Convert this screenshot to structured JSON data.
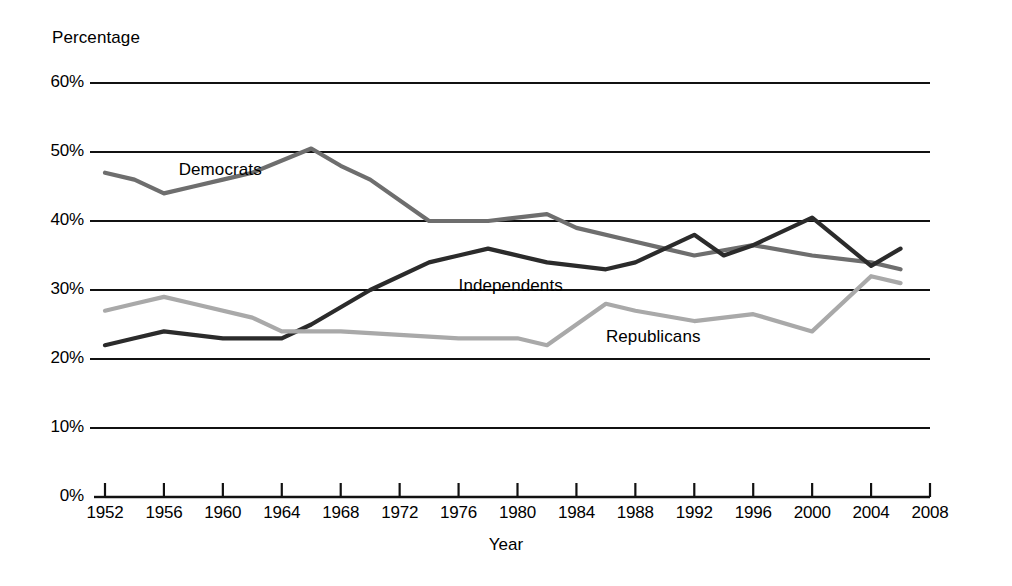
{
  "chart_data": {
    "type": "line",
    "title": "",
    "xlabel": "Year",
    "ylabel": "Percentage",
    "xlim": [
      1952,
      2008
    ],
    "ylim": [
      0,
      60
    ],
    "grid": "horizontal",
    "legend_position": "inline-labels",
    "x_ticks": [
      1952,
      1956,
      1960,
      1964,
      1968,
      1972,
      1976,
      1980,
      1984,
      1988,
      1992,
      1996,
      2000,
      2004,
      2008
    ],
    "x_tick_labels": [
      "1952",
      "1956",
      "1960",
      "1964",
      "1968",
      "1972",
      "1976",
      "1980",
      "1984",
      "1988",
      "1992",
      "1996",
      "2000",
      "2004",
      "2008"
    ],
    "y_ticks": [
      0,
      10,
      20,
      30,
      40,
      50,
      60
    ],
    "y_tick_labels": [
      "0%",
      "10%",
      "20%",
      "30%",
      "40%",
      "50%",
      "60%"
    ],
    "series": [
      {
        "name": "Democrats",
        "color": "#6e6e6e",
        "label_x": 1957,
        "label_y": 47.2,
        "x": [
          1952,
          1954,
          1956,
          1958,
          1960,
          1962,
          1966,
          1968,
          1970,
          1974,
          1976,
          1978,
          1982,
          1984,
          1988,
          1990,
          1992,
          1996,
          2000,
          2004,
          2006
        ],
        "values": [
          47,
          46,
          44,
          45,
          46,
          47,
          50.5,
          48,
          46,
          40,
          40,
          40,
          41,
          39,
          37,
          36,
          35,
          36.5,
          35,
          34,
          33
        ]
      },
      {
        "name": "Independents",
        "color": "#2b2b2b",
        "label_x": 1976,
        "label_y": 30.5,
        "x": [
          1952,
          1954,
          1956,
          1958,
          1960,
          1962,
          1964,
          1966,
          1970,
          1974,
          1976,
          1978,
          1982,
          1986,
          1988,
          1992,
          1994,
          1996,
          2000,
          2004,
          2006
        ],
        "values": [
          22,
          23,
          24,
          23.5,
          23,
          23,
          23,
          25,
          30,
          34,
          35,
          36,
          34,
          33,
          34,
          38,
          35,
          36.5,
          40.5,
          33.5,
          36
        ]
      },
      {
        "name": "Republicans",
        "color": "#a9a9a9",
        "label_x": 1986,
        "label_y": 23,
        "x": [
          1952,
          1954,
          1956,
          1958,
          1962,
          1964,
          1968,
          1972,
          1976,
          1980,
          1982,
          1986,
          1988,
          1992,
          1996,
          2000,
          2004,
          2006
        ],
        "values": [
          27,
          28,
          29,
          28,
          26,
          24,
          24,
          23.5,
          23,
          23,
          22,
          28,
          27,
          25.5,
          26.5,
          24,
          32,
          31
        ]
      }
    ]
  },
  "axes": {
    "percentage_label": "Percentage",
    "year_label": "Year"
  }
}
